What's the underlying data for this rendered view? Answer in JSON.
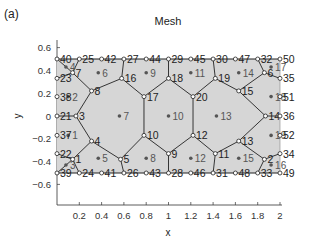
{
  "panel_label": "(a)",
  "title": "Mesh",
  "xlabel": "x",
  "ylabel": "y",
  "axes": {
    "x_ticks": [
      "0.2",
      "0.4",
      "0.6",
      "0.8",
      "1",
      "1.2",
      "1.4",
      "1.6",
      "1.8",
      "2"
    ],
    "x_tick_values": [
      0.2,
      0.4,
      0.6,
      0.8,
      1.0,
      1.2,
      1.4,
      1.6,
      1.8,
      2.0
    ],
    "y_ticks": [
      "0.6",
      "0.4",
      "0.2",
      "0",
      "-0.2",
      "-0.4",
      "-0.6"
    ],
    "y_tick_values": [
      0.6,
      0.4,
      0.2,
      0,
      -0.2,
      -0.4,
      -0.6
    ],
    "xlim": [
      0,
      2
    ],
    "ylim": [
      -0.75,
      0.75
    ]
  },
  "colors": {
    "fill": "#d6d6d6",
    "edge": "#222222",
    "node": "#222222",
    "cell_label": "#555555",
    "axis": "#333333"
  },
  "nodes": [
    {
      "id": "1",
      "x": 0.14,
      "y": -0.38
    },
    {
      "id": "2",
      "x": 1.86,
      "y": -0.38
    },
    {
      "id": "3",
      "x": 0.17,
      "y": 0.0
    },
    {
      "id": "4",
      "x": 0.31,
      "y": -0.22
    },
    {
      "id": "5",
      "x": 0.57,
      "y": -0.38
    },
    {
      "id": "6",
      "x": 1.86,
      "y": 0.38
    },
    {
      "id": "7",
      "x": 0.14,
      "y": 0.38
    },
    {
      "id": "8",
      "x": 0.31,
      "y": 0.22
    },
    {
      "id": "9",
      "x": 1.0,
      "y": -0.33
    },
    {
      "id": "10",
      "x": 0.78,
      "y": -0.17
    },
    {
      "id": "11",
      "x": 1.42,
      "y": -0.33
    },
    {
      "id": "12",
      "x": 1.22,
      "y": -0.17
    },
    {
      "id": "13",
      "x": 1.63,
      "y": -0.22
    },
    {
      "id": "14",
      "x": 1.87,
      "y": 0.0
    },
    {
      "id": "15",
      "x": 1.63,
      "y": 0.22
    },
    {
      "id": "16",
      "x": 0.58,
      "y": 0.33
    },
    {
      "id": "17",
      "x": 0.78,
      "y": 0.17
    },
    {
      "id": "18",
      "x": 1.0,
      "y": 0.33
    },
    {
      "id": "19",
      "x": 1.42,
      "y": 0.33
    },
    {
      "id": "20",
      "x": 1.22,
      "y": 0.17
    },
    {
      "id": "21",
      "x": 0.0,
      "y": 0.0
    },
    {
      "id": "22",
      "x": 0.0,
      "y": -0.33
    },
    {
      "id": "23",
      "x": 0.0,
      "y": 0.33
    },
    {
      "id": "24",
      "x": 0.2,
      "y": -0.5
    },
    {
      "id": "25",
      "x": 0.2,
      "y": 0.5
    },
    {
      "id": "26",
      "x": 0.6,
      "y": -0.5
    },
    {
      "id": "27",
      "x": 0.6,
      "y": 0.5
    },
    {
      "id": "28",
      "x": 1.0,
      "y": -0.5
    },
    {
      "id": "29",
      "x": 1.0,
      "y": 0.5
    },
    {
      "id": "30",
      "x": 1.4,
      "y": 0.5
    },
    {
      "id": "31",
      "x": 1.4,
      "y": -0.5
    },
    {
      "id": "32",
      "x": 1.8,
      "y": 0.5
    },
    {
      "id": "33",
      "x": 1.8,
      "y": -0.5
    },
    {
      "id": "34",
      "x": 2.0,
      "y": -0.33
    },
    {
      "id": "35",
      "x": 2.0,
      "y": 0.33
    },
    {
      "id": "36",
      "x": 2.0,
      "y": 0.0
    },
    {
      "id": "37",
      "x": 0.0,
      "y": -0.17
    },
    {
      "id": "38",
      "x": 0.0,
      "y": 0.17
    },
    {
      "id": "39",
      "x": 0.0,
      "y": -0.5
    },
    {
      "id": "40",
      "x": 0.0,
      "y": 0.5
    },
    {
      "id": "41",
      "x": 0.4,
      "y": -0.5
    },
    {
      "id": "42",
      "x": 0.4,
      "y": 0.5
    },
    {
      "id": "43",
      "x": 0.8,
      "y": -0.5
    },
    {
      "id": "44",
      "x": 0.8,
      "y": 0.5
    },
    {
      "id": "45",
      "x": 1.2,
      "y": 0.5
    },
    {
      "id": "46",
      "x": 1.2,
      "y": -0.5
    },
    {
      "id": "47",
      "x": 1.6,
      "y": 0.5
    },
    {
      "id": "48",
      "x": 1.6,
      "y": -0.5
    },
    {
      "id": "49",
      "x": 2.0,
      "y": -0.5
    },
    {
      "id": "50",
      "x": 2.0,
      "y": 0.5
    },
    {
      "id": "51",
      "x": 2.0,
      "y": 0.17
    },
    {
      "id": "52",
      "x": 2.0,
      "y": -0.17
    }
  ],
  "edges": [
    [
      "40",
      "7"
    ],
    [
      "7",
      "23"
    ],
    [
      "7",
      "25"
    ],
    [
      "7",
      "8"
    ],
    [
      "8",
      "3"
    ],
    [
      "8",
      "16"
    ],
    [
      "3",
      "21"
    ],
    [
      "3",
      "4"
    ],
    [
      "16",
      "27"
    ],
    [
      "16",
      "17"
    ],
    [
      "17",
      "10"
    ],
    [
      "17",
      "18"
    ],
    [
      "18",
      "29"
    ],
    [
      "18",
      "20"
    ],
    [
      "20",
      "12"
    ],
    [
      "20",
      "19"
    ],
    [
      "19",
      "30"
    ],
    [
      "19",
      "15"
    ],
    [
      "15",
      "6"
    ],
    [
      "15",
      "14"
    ],
    [
      "6",
      "32"
    ],
    [
      "6",
      "35"
    ],
    [
      "14",
      "36"
    ],
    [
      "4",
      "1"
    ],
    [
      "4",
      "5"
    ],
    [
      "1",
      "22"
    ],
    [
      "1",
      "24"
    ],
    [
      "1",
      "39"
    ],
    [
      "5",
      "26"
    ],
    [
      "5",
      "10"
    ],
    [
      "10",
      "9"
    ],
    [
      "9",
      "28"
    ],
    [
      "9",
      "12"
    ],
    [
      "12",
      "11"
    ],
    [
      "11",
      "31"
    ],
    [
      "11",
      "13"
    ],
    [
      "13",
      "14"
    ],
    [
      "13",
      "2"
    ],
    [
      "2",
      "34"
    ],
    [
      "2",
      "33"
    ]
  ],
  "cells": [
    {
      "id": "1",
      "x": 0.1,
      "y": -0.17
    },
    {
      "id": "2",
      "x": 0.1,
      "y": 0.17
    },
    {
      "id": "3",
      "x": 0.08,
      "y": -0.43
    },
    {
      "id": "4",
      "x": 0.08,
      "y": 0.43
    },
    {
      "id": "5",
      "x": 0.37,
      "y": -0.37
    },
    {
      "id": "6",
      "x": 0.37,
      "y": 0.38
    },
    {
      "id": "7",
      "x": 0.56,
      "y": 0.0
    },
    {
      "id": "8",
      "x": 0.8,
      "y": -0.37
    },
    {
      "id": "9",
      "x": 0.8,
      "y": 0.38
    },
    {
      "id": "10",
      "x": 1.0,
      "y": 0.0
    },
    {
      "id": "11",
      "x": 1.2,
      "y": 0.38
    },
    {
      "id": "12",
      "x": 1.2,
      "y": -0.37
    },
    {
      "id": "13",
      "x": 1.43,
      "y": 0.0
    },
    {
      "id": "14",
      "x": 1.63,
      "y": 0.38
    },
    {
      "id": "15",
      "x": 1.63,
      "y": -0.37
    },
    {
      "id": "16",
      "x": 1.92,
      "y": -0.43
    },
    {
      "id": "17",
      "x": 1.92,
      "y": 0.43
    },
    {
      "id": "18",
      "x": 1.92,
      "y": 0.17
    },
    {
      "id": "19",
      "x": 1.92,
      "y": -0.17
    }
  ],
  "node_label_offsets": {
    "40": "r",
    "25": "r",
    "42": "r",
    "27": "r",
    "44": "r",
    "29": "r",
    "45": "r",
    "30": "r",
    "47": "r",
    "32": "r",
    "50": "r",
    "39": "r",
    "24": "r",
    "41": "r",
    "26": "r",
    "43": "r",
    "28": "r",
    "46": "r",
    "31": "r",
    "48": "r",
    "33": "r",
    "49": "r",
    "23": "r",
    "38": "r",
    "21": "r",
    "37": "r",
    "22": "r",
    "35": "r",
    "51": "r",
    "36": "r",
    "52": "r",
    "34": "r"
  }
}
